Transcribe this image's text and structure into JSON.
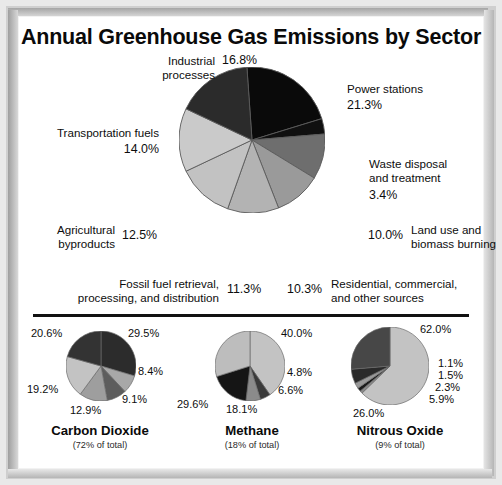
{
  "title": "Annual Greenhouse Gas Emissions by Sector",
  "colors": {
    "frame": "#cfcfcf",
    "background": "#ffffff",
    "text": "#0d0d0d",
    "divider": "#111111",
    "slice_black": "#272727",
    "slice_very_dark": "#0a0a0a",
    "slice_dark_gray": "#6e6e6e",
    "slice_mid_gray": "#8f8f8f",
    "slice_gray": "#a5a5a5",
    "slice_light_gray": "#bdbdbd",
    "slice_lighter_gray": "#cdcdcd",
    "stroke": "#4a4a4a"
  },
  "chart_data": [
    {
      "type": "pie",
      "id": "main-sector-pie",
      "title": "Annual Greenhouse Gas Emissions by Sector",
      "start_angle_deg": -4,
      "categories": [
        "Power stations",
        "Waste disposal and treatment",
        "Land use and biomass burning",
        "Residential, commercial, and other sources",
        "Fossil fuel retrieval, processing, and distribution",
        "Agricultural byproducts",
        "Transportation fuels",
        "Industrial processes"
      ],
      "values": [
        21.3,
        3.4,
        10.0,
        10.3,
        11.3,
        12.5,
        14.0,
        16.8
      ],
      "value_labels": [
        "21.3%",
        "3.4%",
        "10.0%",
        "10.3%",
        "11.3%",
        "12.5%",
        "14.0%",
        "16.8%"
      ],
      "slice_colors": [
        "#0a0a0a",
        "#101010",
        "#6e6e6e",
        "#9a9a9a",
        "#b3b3b3",
        "#c2c2c2",
        "#cacaca",
        "#2b2b2b"
      ]
    },
    {
      "type": "pie",
      "id": "carbon-dioxide-pie",
      "title": "Carbon Dioxide",
      "subtitle": "(72% of total)",
      "start_angle_deg": 0,
      "categories": [
        "slice-1",
        "slice-2",
        "slice-3",
        "slice-4",
        "slice-5",
        "slice-6"
      ],
      "values": [
        29.5,
        8.4,
        9.1,
        12.9,
        19.2,
        20.6
      ],
      "value_labels": [
        "29.5%",
        "8.4%",
        "9.1%",
        "12.9%",
        "19.2%",
        "20.6%"
      ],
      "slice_colors": [
        "#2c2c2c",
        "#a8a8a8",
        "#5d5d5d",
        "#9e9e9e",
        "#c3c3c3",
        "#333333"
      ]
    },
    {
      "type": "pie",
      "id": "methane-pie",
      "title": "Methane",
      "subtitle": "(18% of total)",
      "start_angle_deg": 0,
      "categories": [
        "slice-1",
        "slice-2",
        "slice-3",
        "slice-4",
        "slice-5"
      ],
      "values": [
        40.0,
        4.8,
        6.6,
        18.1,
        29.6
      ],
      "value_labels": [
        "40.0%",
        "4.8%",
        "6.6%",
        "18.1%",
        "29.6%"
      ],
      "slice_colors": [
        "#c3c3c3",
        "#3a3a3a",
        "#8b8b8b",
        "#151515",
        "#bdbdbd"
      ]
    },
    {
      "type": "pie",
      "id": "nitrous-oxide-pie",
      "title": "Nitrous Oxide",
      "subtitle": "(9% of total)",
      "start_angle_deg": 0,
      "categories": [
        "slice-1",
        "slice-2",
        "slice-3",
        "slice-4",
        "slice-5",
        "slice-6"
      ],
      "values": [
        62.0,
        1.1,
        1.5,
        2.3,
        5.9,
        26.0
      ],
      "value_labels": [
        "62.0%",
        "1.1%",
        "1.5%",
        "2.3%",
        "5.9%",
        "26.0%"
      ],
      "slice_colors": [
        "#c3c3c3",
        "#8a8a8a",
        "#1a1a1a",
        "#999999",
        "#2a2a2a",
        "#474747"
      ]
    }
  ],
  "main_labels": [
    {
      "name": "power-stations",
      "text": "Power stations",
      "pct": "21.3%"
    },
    {
      "name": "waste-disposal",
      "line1": "Waste disposal",
      "line2": "and treatment",
      "pct": "3.4%"
    },
    {
      "name": "land-use",
      "text": "Land use and",
      "text2": "biomass burning",
      "pct": "10.0%"
    },
    {
      "name": "residential",
      "text": "Residential, commercial,",
      "text2": "and other sources",
      "pct": "10.3%"
    },
    {
      "name": "fossil-fuel-retrieval",
      "text": "Fossil fuel retrieval,",
      "text2": "processing, and distribution",
      "pct": "11.3%"
    },
    {
      "name": "agricultural",
      "text": "Agricultural",
      "text2": "byproducts",
      "pct": "12.5%"
    },
    {
      "name": "transportation-fuels",
      "text": "Transportation fuels",
      "pct": "14.0%"
    },
    {
      "name": "industrial-processes",
      "text": "Industrial",
      "text2": "processes",
      "pct": "16.8%"
    }
  ],
  "bottom_charts": [
    {
      "name": "Carbon Dioxide",
      "subtitle": "(72% of total)",
      "labels": [
        "29.5%",
        "8.4%",
        "9.1%",
        "12.9%",
        "19.2%",
        "20.6%"
      ]
    },
    {
      "name": "Methane",
      "subtitle": "(18% of total)",
      "labels": [
        "40.0%",
        "4.8%",
        "6.6%",
        "18.1%",
        "29.6%"
      ]
    },
    {
      "name": "Nitrous Oxide",
      "subtitle": "(9% of total)",
      "labels": [
        "62.0%",
        "1.1%",
        "1.5%",
        "2.3%",
        "5.9%",
        "26.0%"
      ]
    }
  ]
}
